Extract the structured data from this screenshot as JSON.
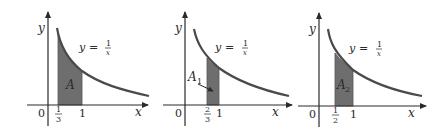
{
  "panels": [
    {
      "id": "panel-1",
      "equation": {
        "lhs": "y",
        "eq": "=",
        "num": "1",
        "den": "x"
      },
      "axis_labels": {
        "x": "x",
        "y": "y",
        "origin": "0"
      },
      "ticks": [
        {
          "kind": "fraction",
          "num": "1",
          "den": "3"
        },
        {
          "kind": "plain",
          "text": "1"
        }
      ],
      "region_label": {
        "main": "A",
        "sub": ""
      },
      "shaded_interval": [
        "1/3",
        "1"
      ]
    },
    {
      "id": "panel-2",
      "equation": {
        "lhs": "y",
        "eq": "=",
        "num": "1",
        "den": "x"
      },
      "axis_labels": {
        "x": "x",
        "y": "y",
        "origin": "0"
      },
      "ticks": [
        {
          "kind": "fraction",
          "num": "2",
          "den": "3"
        },
        {
          "kind": "plain",
          "text": "1"
        }
      ],
      "region_label": {
        "main": "A",
        "sub": "1"
      },
      "shaded_interval": [
        "2/3",
        "1"
      ]
    },
    {
      "id": "panel-3",
      "equation": {
        "lhs": "y",
        "eq": "=",
        "num": "1",
        "den": "x"
      },
      "axis_labels": {
        "x": "x",
        "y": "y",
        "origin": "0"
      },
      "ticks": [
        {
          "kind": "fraction",
          "num": "1",
          "den": "2"
        },
        {
          "kind": "plain",
          "text": "1"
        }
      ],
      "region_label": {
        "main": "A",
        "sub": "2"
      },
      "shaded_interval": [
        "1/2",
        "1"
      ]
    }
  ],
  "colors": {
    "curve": "#4a4a4a",
    "shade": "#6e6e6e",
    "axis": "#2a2a2a"
  }
}
